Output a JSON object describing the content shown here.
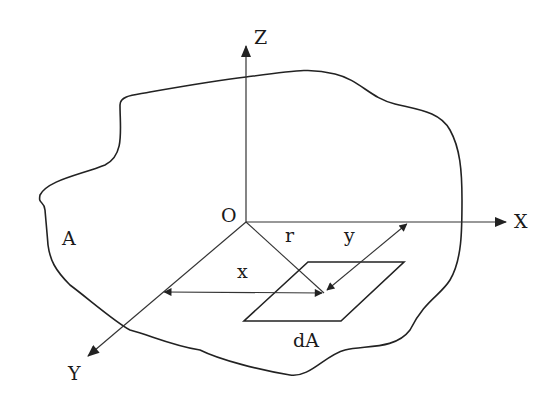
{
  "colors": {
    "stroke": "#222222",
    "background": "#ffffff"
  },
  "labels": {
    "z_axis": "Z",
    "x_axis": "X",
    "y_axis": "Y",
    "origin": "O",
    "region": "A",
    "element": "dA",
    "radius": "r",
    "x_dist": "x",
    "y_dist": "y"
  },
  "geometry": {
    "origin": [
      246,
      222
    ],
    "z_end": [
      246,
      46
    ],
    "x_end": [
      506,
      222
    ],
    "y_end": [
      88,
      356
    ],
    "point": [
      324,
      293
    ],
    "boundary_path": "M 246,77 C 300,70 312,68 335,74 C 360,80 370,98 395,104 C 420,110 440,112 450,130 C 460,148 462,170 462,200 C 462,230 462,260 450,280 C 440,296 425,300 410,330 C 395,350 365,345 345,350 C 325,355 310,378 290,375 C 260,370 220,360 200,350 C 170,345 150,335 130,330 C 115,322 90,300 70,285 C 55,270 50,260 48,245 C 47,232 46,222 45,210 C 44,200 38,205 40,195 C 48,180 80,175 105,165 C 125,155 120,130 120,105 C 120,95 135,95 150,92 C 190,85 220,80 246,77 Z",
    "parallelogram": [
      [
        308,
        262
      ],
      [
        404,
        262
      ],
      [
        341,
        321
      ],
      [
        244,
        321
      ]
    ]
  }
}
